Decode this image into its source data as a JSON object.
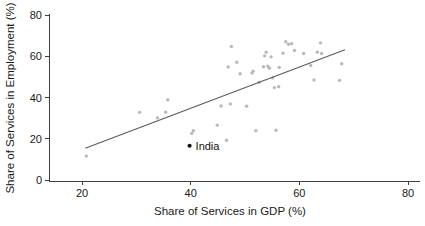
{
  "chart_data": {
    "type": "scatter",
    "title": "",
    "xlabel": "Share of Services in GDP (%)",
    "ylabel": "Share of Services in Employment (%)",
    "xlim": [
      13,
      85
    ],
    "ylim": [
      -2,
      82
    ],
    "xticks": [
      20,
      40,
      60,
      80
    ],
    "xtick_labels": [
      "20",
      "40",
      "60",
      "80"
    ],
    "yticks": [
      0,
      20,
      40,
      60,
      80
    ],
    "ytick_labels": [
      "0",
      "20",
      "40",
      "60",
      "80"
    ],
    "grid": false,
    "legend": "none",
    "series": [
      {
        "name": "Countries",
        "marker": "dot",
        "color": "#b9b9b9",
        "points": [
          [
            20.8,
            11.6
          ],
          [
            30.6,
            32.8
          ],
          [
            33.9,
            30.1
          ],
          [
            35.4,
            32.9
          ],
          [
            35.8,
            38.9
          ],
          [
            40.2,
            22.6
          ],
          [
            40.5,
            23.9
          ],
          [
            44.9,
            26.6
          ],
          [
            45.6,
            35.9
          ],
          [
            46.6,
            19.3
          ],
          [
            46.9,
            54.8
          ],
          [
            47.3,
            36.9
          ],
          [
            47.5,
            64.7
          ],
          [
            48.5,
            57.1
          ],
          [
            49.1,
            51.5
          ],
          [
            50.3,
            35.8
          ],
          [
            51.3,
            51.9
          ],
          [
            51.5,
            52.8
          ],
          [
            52.0,
            23.9
          ],
          [
            52.6,
            47.4
          ],
          [
            53.4,
            54.9
          ],
          [
            53.6,
            60.2
          ],
          [
            53.9,
            62.0
          ],
          [
            54.2,
            55.2
          ],
          [
            54.5,
            54.2
          ],
          [
            54.8,
            59.7
          ],
          [
            55.1,
            49.5
          ],
          [
            55.4,
            44.8
          ],
          [
            55.7,
            24.1
          ],
          [
            56.2,
            45.2
          ],
          [
            56.3,
            54.6
          ],
          [
            57.0,
            61.5
          ],
          [
            57.5,
            67.0
          ],
          [
            58.0,
            65.8
          ],
          [
            58.6,
            66.1
          ],
          [
            59.1,
            62.8
          ],
          [
            60.8,
            61.3
          ],
          [
            62.1,
            55.5
          ],
          [
            62.7,
            48.5
          ],
          [
            63.3,
            62.0
          ],
          [
            63.9,
            66.5
          ],
          [
            64.1,
            61.3
          ],
          [
            67.4,
            48.3
          ],
          [
            67.8,
            56.4
          ]
        ]
      }
    ],
    "fit_line": {
      "name": "linear fit",
      "color": "#5a5a5a",
      "x0": 20.6,
      "y0": 15.4,
      "x1": 68.4,
      "y1": 63.2
    },
    "annotations": [
      {
        "label": "India",
        "x": 39.8,
        "y": 16.6,
        "marker": "dot",
        "color": "#111111"
      }
    ]
  }
}
